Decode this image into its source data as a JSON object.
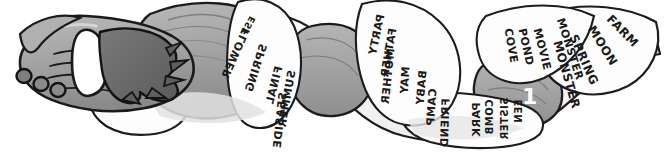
{
  "image": {
    "title": "Gloved hand holding a long wavy scroll covered in hand-lettered words",
    "medium": "grayscale cartoon illustration / pen and ink with grey wash",
    "background_color": "#ffffff",
    "ink_color": "#1a1a1a",
    "paper_color": "#fcfcfc",
    "glove_light_gray": "#a9a9a9",
    "glove_dark_gray": "#6e6e6e",
    "shadow_gray": "#c9c9c9",
    "width": 666,
    "height": 155
  },
  "subjects": [
    {
      "name": "gloved-hand",
      "description": "A large cartoon hand in a grey glove with a white cuff, fingers curled, wearing three dark rings on the fingers"
    },
    {
      "name": "ring",
      "description": "Dark round ring on finger",
      "count": 3
    },
    {
      "name": "glove-cuff",
      "description": "White band at the wrist of the glove"
    },
    {
      "name": "fringe",
      "description": "Dark shaggy fringe / fur trim at the wrist"
    },
    {
      "name": "scroll-banner",
      "description": "A long pale ribbon of paper that snakes from the hand to the right edge, twisting so some faces are seen from the back"
    }
  ],
  "scroll": {
    "label": "word-scroll",
    "note": "Words are hand-lettered along the ribbon; many appear mirrored because the paper is twisted and seen from behind.",
    "segments": [
      {
        "id": "segment-1",
        "name": "first-twist-panel",
        "orientation": "mirrored",
        "words": [
          "EST",
          "FLOWER",
          "SPRING",
          "FINAL",
          "SUMMER",
          "SEASIDE"
        ]
      },
      {
        "id": "segment-2",
        "name": "second-panel",
        "orientation": "mirrored",
        "words": [
          "PARTY",
          "FATHER",
          "MOTHER",
          "MAY",
          "BABY",
          "CAMP",
          "FRIEND"
        ]
      },
      {
        "id": "segment-3",
        "name": "third-panel",
        "orientation": "mirrored",
        "words": [
          "PARK",
          "COMB",
          "SISTER",
          "EEN"
        ]
      },
      {
        "id": "segment-4",
        "name": "fourth-panel",
        "orientation": "upright",
        "words": [
          "MONSTER",
          "MOVIE",
          "POND",
          "COVE"
        ]
      },
      {
        "id": "segment-5",
        "name": "end-panel",
        "orientation": "upright",
        "words": [
          "FARM",
          "MOON",
          "SPRING",
          "MONSTER"
        ]
      }
    ],
    "all_words": [
      "EST",
      "FLOWER",
      "SPRING",
      "FINAL",
      "SUMMER",
      "SEASIDE",
      "PARTY",
      "FATHER",
      "MOTHER",
      "MAY",
      "BABY",
      "CAMP",
      "FRIEND",
      "PARK",
      "COMB",
      "SISTER",
      "EEN",
      "MONSTER",
      "MOVIE",
      "POND",
      "COVE",
      "FARM",
      "MOON"
    ]
  },
  "words": {
    "w_est": {
      "text": "EST",
      "x": 253,
      "y": 12,
      "rot": -62,
      "size": 9,
      "mirror": true
    },
    "w_flower": {
      "text": "FLOWER",
      "x": 249,
      "y": 18,
      "rot": -66,
      "size": 11,
      "mirror": true
    },
    "w_spring": {
      "text": "SPRING",
      "x": 266,
      "y": 35,
      "rot": -72,
      "size": 11,
      "mirror": true
    },
    "w_final": {
      "text": "FINAL",
      "x": 281,
      "y": 58,
      "rot": -78,
      "size": 11,
      "mirror": true
    },
    "w_summer": {
      "text": "SUMMER",
      "x": 294,
      "y": 62,
      "rot": -80,
      "size": 11,
      "mirror": true
    },
    "w_seaside": {
      "text": "SEASIDE",
      "x": 285,
      "y": 82,
      "rot": -84,
      "size": 11,
      "mirror": true
    },
    "w_party": {
      "text": "PARTY",
      "x": 380,
      "y": 6,
      "rot": -78,
      "size": 11,
      "mirror": true
    },
    "w_father": {
      "text": "FATHER",
      "x": 392,
      "y": 18,
      "rot": -80,
      "size": 11,
      "mirror": true
    },
    "w_mother": {
      "text": "MOTHER",
      "x": 390,
      "y": 38,
      "rot": -84,
      "size": 11,
      "mirror": true
    },
    "w_may": {
      "text": "MAY",
      "x": 404,
      "y": 56,
      "rot": -86,
      "size": 11,
      "mirror": true
    },
    "w_baby": {
      "text": "BABY",
      "x": 422,
      "y": 60,
      "rot": -85,
      "size": 11,
      "mirror": true
    },
    "w_camp": {
      "text": "CAMP",
      "x": 431,
      "y": 78,
      "rot": -86,
      "size": 11,
      "mirror": true
    },
    "w_friend": {
      "text": "FRIEND",
      "x": 444,
      "y": 90,
      "rot": -88,
      "size": 11,
      "mirror": true
    },
    "w_park": {
      "text": "PARK",
      "x": 474,
      "y": 94,
      "rot": -90,
      "size": 11,
      "mirror": true
    },
    "w_comb": {
      "text": "COMB",
      "x": 487,
      "y": 92,
      "rot": -90,
      "size": 10,
      "mirror": true
    },
    "w_sister": {
      "text": "SISTER",
      "x": 502,
      "y": 90,
      "rot": -90,
      "size": 10,
      "mirror": true
    },
    "w_een": {
      "text": "EEN",
      "x": 516,
      "y": 92,
      "rot": -90,
      "size": 10,
      "mirror": true
    },
    "w_monster": {
      "text": "MONSTER",
      "x": 560,
      "y": 12,
      "rot": 72,
      "size": 11,
      "mirror": false
    },
    "w_movie": {
      "text": "MOVIE",
      "x": 536,
      "y": 22,
      "rot": 76,
      "size": 11,
      "mirror": false
    },
    "w_pond": {
      "text": "POND",
      "x": 522,
      "y": 22,
      "rot": 78,
      "size": 11,
      "mirror": false
    },
    "w_cove": {
      "text": "COVE",
      "x": 508,
      "y": 22,
      "rot": 80,
      "size": 11,
      "mirror": false
    },
    "w_farm": {
      "text": "FARM",
      "x": 609,
      "y": 8,
      "rot": 46,
      "size": 12,
      "mirror": false
    },
    "w_moon": {
      "text": "MOON",
      "x": 590,
      "y": 18,
      "rot": 58,
      "size": 12,
      "mirror": false
    },
    "w_spring2": {
      "text": "SPRING",
      "x": 572,
      "y": 26,
      "rot": 66,
      "size": 12,
      "mirror": false
    },
    "w_monster2": {
      "text": "MONSTER",
      "x": 556,
      "y": 32,
      "rot": 74,
      "size": 12,
      "mirror": false
    }
  }
}
